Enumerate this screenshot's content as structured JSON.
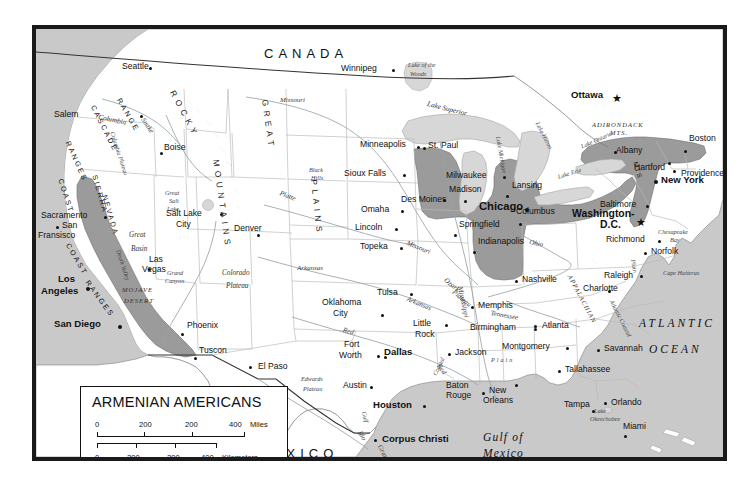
{
  "map": {
    "title": "ARMENIAN AMERICANS",
    "theme_note": "Shaded areas indicate regions of Armenian American population concentration",
    "colors": {
      "ocean": "#c9c9c9",
      "land": "#ffffff",
      "shaded_population": "#9b9b9b",
      "lake": "#d7d7d7",
      "border": "#1a1a1a",
      "state_line": "#b4b4b4",
      "river": "#9aa3a8"
    },
    "legend": {
      "title": "ARMENIAN AMERICANS",
      "miles_scale": {
        "ticks": [
          "0",
          "200",
          "200",
          "400"
        ],
        "unit": "Miles"
      },
      "kilometers_scale": {
        "ticks": [
          "0",
          "200",
          "200",
          "400"
        ],
        "unit": "Kilometers"
      }
    },
    "countries": [
      {
        "name": "CANADA",
        "x": 260,
        "y": 43
      },
      {
        "name": "MEXICO",
        "x": 253,
        "y": 443
      }
    ],
    "oceans": [
      {
        "name": "ATLANTIC",
        "x": 635,
        "y": 314
      },
      {
        "name": "OCEAN",
        "x": 645,
        "y": 340
      },
      {
        "name": "Gulf of",
        "x": 479,
        "y": 428
      },
      {
        "name": "Mexico",
        "x": 479,
        "y": 444
      }
    ],
    "cities": [
      {
        "name": "Seattle",
        "x": 108,
        "y": 59,
        "dx": 41,
        "dy": 4,
        "class": "city"
      },
      {
        "name": "Salem",
        "x": 50,
        "y": 110,
        "dx": 36,
        "dy": 3,
        "class": "city"
      },
      {
        "name": "Boise",
        "x": 158,
        "y": 138,
        "dx": -4,
        "dy": 11,
        "class": "city"
      },
      {
        "name": "Sacramento",
        "x": 37,
        "y": 209,
        "dx": 63,
        "dy": 4,
        "class": "city"
      },
      {
        "name": "San",
        "x": 60,
        "y": 219,
        "dx": -8,
        "dy": 4,
        "class": "city"
      },
      {
        "name": "Fransisco",
        "x": 42,
        "y": 229,
        "dx": null,
        "dy": null,
        "class": "city"
      },
      {
        "name": "Los",
        "x": 55,
        "y": 270,
        "dx": null,
        "dy": null,
        "class": "city-med"
      },
      {
        "name": "Angeles",
        "x": 41,
        "y": 282,
        "dx": null,
        "dy": null,
        "class": "city-med"
      },
      {
        "name": "San Diego",
        "x": 48,
        "y": 316,
        "dx": 66,
        "dy": 5,
        "class": "city-med"
      },
      {
        "name": "Las",
        "x": 139,
        "y": 253,
        "dx": null,
        "dy": null,
        "class": "city"
      },
      {
        "name": "Vegas",
        "x": 132,
        "y": 263,
        "dx": -4,
        "dy": 12,
        "class": "city"
      },
      {
        "name": "Salt Lake",
        "x": 160,
        "y": 206,
        "dx": 56,
        "dy": 3,
        "class": "city"
      },
      {
        "name": "City",
        "x": 170,
        "y": 217,
        "dx": null,
        "dy": null,
        "class": "city"
      },
      {
        "name": "Phoenix",
        "x": 183,
        "y": 318,
        "dx": -6,
        "dy": 11,
        "class": "city"
      },
      {
        "name": "Tuscon",
        "x": 196,
        "y": 342,
        "dx": -6,
        "dy": 11,
        "class": "city"
      },
      {
        "name": "El Paso",
        "x": 254,
        "y": 359,
        "dx": -9,
        "dy": 4,
        "class": "city"
      },
      {
        "name": "Denver",
        "x": 231,
        "y": 220,
        "dx": 23,
        "dy": 12,
        "class": "city"
      },
      {
        "name": "Winnipeg",
        "x": 335,
        "y": 67,
        "dx": 53,
        "dy": -2,
        "class": "city"
      },
      {
        "name": "Minneapolis",
        "x": 356,
        "y": 137,
        "dx": 57,
        "dy": 5,
        "class": "city"
      },
      {
        "name": "St. Paul",
        "x": 424,
        "y": 138,
        "dx": -5,
        "dy": 5,
        "class": "city"
      },
      {
        "name": "Sioux Falls",
        "x": 340,
        "y": 167,
        "dx": 59,
        "dy": 3,
        "class": "city"
      },
      {
        "name": "Des Moines",
        "x": 398,
        "y": 192,
        "dx": 63,
        "dy": 4,
        "class": "city"
      },
      {
        "name": "Omaha",
        "x": 357,
        "y": 202,
        "dx": 40,
        "dy": 4,
        "class": "city"
      },
      {
        "name": "Lincoln",
        "x": 351,
        "y": 221,
        "dx": 40,
        "dy": 3,
        "class": "city"
      },
      {
        "name": "Topeka",
        "x": 356,
        "y": 239,
        "dx": 40,
        "dy": 4,
        "class": "city"
      },
      {
        "name": "Milwaukee",
        "x": 442,
        "y": 167,
        "dx": 57,
        "dy": 5,
        "class": "city"
      },
      {
        "name": "Madison",
        "x": 445,
        "y": 181,
        "dx": -6,
        "dy": 11,
        "class": "city"
      },
      {
        "name": "Lansing",
        "x": 508,
        "y": 177,
        "dx": -6,
        "dy": 11,
        "class": "city"
      },
      {
        "name": "Chicago",
        "x": 475,
        "y": 198,
        "dx": 47,
        "dy": 6,
        "class": "city-big"
      },
      {
        "name": "Springfield",
        "x": 455,
        "y": 216,
        "dx": -4,
        "dy": 12,
        "class": "city"
      },
      {
        "name": "Indianapolis",
        "x": 474,
        "y": 233,
        "dx": -4,
        "dy": 12,
        "class": "city"
      },
      {
        "name": "Columbus",
        "x": 512,
        "y": 203,
        "dx": 3,
        "dy": 12,
        "class": "city"
      },
      {
        "name": "Ottawa",
        "x": 578,
        "y": 92,
        "dx": null,
        "dy": null,
        "class": "city-med"
      },
      {
        "name": "Albany",
        "x": 612,
        "y": 143,
        "dx": 36,
        "dy": 3,
        "class": "city"
      },
      {
        "name": "Boston",
        "x": 685,
        "y": 131,
        "dx": -5,
        "dy": 11,
        "class": "city"
      },
      {
        "name": "Hartford",
        "x": 630,
        "y": 159,
        "dx": 36,
        "dy": -8,
        "class": "city"
      },
      {
        "name": "Providence",
        "x": 677,
        "y": 155,
        "dx": -6,
        "dy": -4,
        "class": "city"
      },
      {
        "name": "New York",
        "x": 657,
        "y": 170,
        "dx": -9,
        "dy": 5,
        "class": "city-med"
      },
      {
        "name": "Baltimore",
        "x": 596,
        "y": 196,
        "dx": 47,
        "dy": 4,
        "class": "city"
      },
      {
        "name": "Washington-",
        "x": 585,
        "y": 205,
        "dx": null,
        "dy": null,
        "class": "capital"
      },
      {
        "name": "D.C.",
        "x": 605,
        "y": 216,
        "dx": null,
        "dy": null,
        "class": "capital"
      },
      {
        "name": "Richmond",
        "x": 603,
        "y": 231,
        "dx": 52,
        "dy": 5,
        "class": "city"
      },
      {
        "name": "Norfolk",
        "x": 648,
        "y": 243,
        "dx": -8,
        "dy": 4,
        "class": "city"
      },
      {
        "name": "Raleigh",
        "x": 600,
        "y": 268,
        "dx": 37,
        "dy": 2,
        "class": "city"
      },
      {
        "name": "Charlotte",
        "x": 580,
        "y": 287,
        "dx": -7,
        "dy": -6,
        "class": "city"
      },
      {
        "name": "Nashville",
        "x": 517,
        "y": 271,
        "dx": -9,
        "dy": 3,
        "class": "city"
      },
      {
        "name": "Memphis",
        "x": 473,
        "y": 297,
        "dx": -9,
        "dy": 4,
        "class": "city"
      },
      {
        "name": "Birmingham",
        "x": 468,
        "y": 319,
        "dx": 63,
        "dy": 4,
        "class": "city"
      },
      {
        "name": "Atlanta",
        "x": 538,
        "y": 317,
        "dx": -8,
        "dy": 3,
        "class": "city"
      },
      {
        "name": "Montgomery",
        "x": 500,
        "y": 338,
        "dx": 63,
        "dy": 4,
        "class": "city"
      },
      {
        "name": "Savannah",
        "x": 601,
        "y": 340,
        "dx": -8,
        "dy": 3,
        "class": "city"
      },
      {
        "name": "Tallahassee",
        "x": 562,
        "y": 361,
        "dx": -8,
        "dy": 3,
        "class": "city"
      },
      {
        "name": "Tampa",
        "x": 562,
        "y": 396,
        "dx": 36,
        "dy": 7,
        "class": "city"
      },
      {
        "name": "Orlando",
        "x": 608,
        "y": 394,
        "dx": -8,
        "dy": 2,
        "class": "city"
      },
      {
        "name": "Miami",
        "x": 620,
        "y": 418,
        "dx": 10,
        "dy": 11,
        "class": "city"
      },
      {
        "name": "Jackson",
        "x": 452,
        "y": 344,
        "dx": -8,
        "dy": 4,
        "class": "city"
      },
      {
        "name": "Baton",
        "x": 443,
        "y": 379,
        "dx": 38,
        "dy": -2,
        "class": "city"
      },
      {
        "name": "Rouge",
        "x": 443,
        "y": 389,
        "dx": null,
        "dy": null,
        "class": "city"
      },
      {
        "name": "New",
        "x": 486,
        "y": 382,
        "dx": -7,
        "dy": 3,
        "class": "city"
      },
      {
        "name": "Orleans",
        "x": 480,
        "y": 392,
        "dx": null,
        "dy": null,
        "class": "city"
      },
      {
        "name": "Little",
        "x": 410,
        "y": 314,
        "dx": 31,
        "dy": 3,
        "class": "city"
      },
      {
        "name": "Rock",
        "x": 412,
        "y": 325,
        "dx": null,
        "dy": null,
        "class": "city"
      },
      {
        "name": "Tulsa",
        "x": 374,
        "y": 283,
        "dx": 32,
        "dy": 3,
        "class": "city"
      },
      {
        "name": "Oklahoma",
        "x": 319,
        "y": 294,
        "dx": 58,
        "dy": 14,
        "class": "city"
      },
      {
        "name": "City",
        "x": 330,
        "y": 305,
        "dx": null,
        "dy": null,
        "class": "city"
      },
      {
        "name": "Fort",
        "x": 341,
        "y": 336,
        "dx": 39,
        "dy": 12,
        "class": "city"
      },
      {
        "name": "Worth",
        "x": 336,
        "y": 347,
        "dx": null,
        "dy": null,
        "class": "city"
      },
      {
        "name": "Dallas",
        "x": 381,
        "y": 345,
        "dx": -9,
        "dy": 4,
        "class": "city-med"
      },
      {
        "name": "Austin",
        "x": 340,
        "y": 377,
        "dx": 26,
        "dy": 12,
        "class": "city"
      },
      {
        "name": "Houston",
        "x": 370,
        "y": 398,
        "dx": 49,
        "dy": -2,
        "class": "city-med"
      },
      {
        "name": "Corpus Christi",
        "x": 379,
        "y": 430,
        "dx": -9,
        "dy": 4,
        "class": "city-med"
      }
    ],
    "physical_features": [
      {
        "name": "Lake of the",
        "x": 404,
        "y": 58,
        "class": "phys-sm"
      },
      {
        "name": "Woods",
        "x": 406,
        "y": 67,
        "class": "phys-sm"
      },
      {
        "name": "Lake Superior",
        "x": 424,
        "y": 97,
        "class": "phys",
        "rot": 14
      },
      {
        "name": "Lake Michigan",
        "x": 497,
        "y": 132,
        "class": "phys-sm",
        "rot": 80
      },
      {
        "name": "Lake Huron",
        "x": 536,
        "y": 117,
        "class": "phys-sm",
        "rot": 63
      },
      {
        "name": "Lake Erie",
        "x": 553,
        "y": 170,
        "class": "phys-sm",
        "rot": -17
      },
      {
        "name": "Lake Ontario",
        "x": 576,
        "y": 140,
        "class": "phys-sm",
        "rot": -24
      },
      {
        "name": "ADIRONDACK",
        "x": 588,
        "y": 118,
        "class": "phys-cap"
      },
      {
        "name": "MTS.",
        "x": 606,
        "y": 126,
        "class": "phys-cap"
      },
      {
        "name": "Great",
        "x": 161,
        "y": 186,
        "class": "phys-sm"
      },
      {
        "name": "Salt",
        "x": 165,
        "y": 194,
        "class": "phys-sm"
      },
      {
        "name": "Lake",
        "x": 163,
        "y": 202,
        "class": "phys-sm"
      },
      {
        "name": "Great",
        "x": 125,
        "y": 228,
        "class": "phys"
      },
      {
        "name": "Basin",
        "x": 127,
        "y": 242,
        "class": "phys"
      },
      {
        "name": "Death Valley",
        "x": 117,
        "y": 245,
        "class": "phys-sm",
        "rot": 72
      },
      {
        "name": "MOJAVE",
        "x": 118,
        "y": 283,
        "class": "phys-cap"
      },
      {
        "name": "DESERT",
        "x": 120,
        "y": 294,
        "class": "phys-cap"
      },
      {
        "name": "Grand",
        "x": 163,
        "y": 266,
        "class": "phys-sm"
      },
      {
        "name": "Canyon",
        "x": 161,
        "y": 274,
        "class": "phys-sm"
      },
      {
        "name": "Colorado",
        "x": 150,
        "y": 266,
        "class": "phys"
      },
      {
        "name": "Plateau",
        "x": 152,
        "y": 279,
        "class": "phys"
      },
      {
        "name": "Columbia",
        "x": 95,
        "y": 110,
        "class": "phys",
        "rot": 12
      },
      {
        "name": "Columbia Plateau",
        "x": 111,
        "y": 127,
        "class": "phys-sm",
        "rot": 72
      },
      {
        "name": "Black",
        "x": 305,
        "y": 163,
        "class": "phys-sm"
      },
      {
        "name": "Hills",
        "x": 307,
        "y": 171,
        "class": "phys-sm"
      },
      {
        "name": "Ozark",
        "x": 443,
        "y": 273,
        "class": "phys",
        "rot": 40
      },
      {
        "name": "Plateau",
        "x": 451,
        "y": 285,
        "class": "phys",
        "rot": 40
      },
      {
        "name": "Edwards",
        "x": 297,
        "y": 372,
        "class": "phys-sm"
      },
      {
        "name": "Plateau",
        "x": 299,
        "y": 382,
        "class": "phys-sm"
      },
      {
        "name": "Chesapeake",
        "x": 654,
        "y": 225,
        "class": "phys-sm"
      },
      {
        "name": "Bay",
        "x": 666,
        "y": 233,
        "class": "phys-sm"
      },
      {
        "name": "Cape Hatteras",
        "x": 659,
        "y": 266,
        "class": "phys-sm"
      },
      {
        "name": "Lake",
        "x": 590,
        "y": 404,
        "class": "phys-sm"
      },
      {
        "name": "Okeechobee",
        "x": 586,
        "y": 412,
        "class": "phys-sm"
      },
      {
        "name": "APPALACHIAN",
        "x": 568,
        "y": 270,
        "class": "phys-cap",
        "rot": 62
      },
      {
        "name": "Atlantic Coastal",
        "x": 610,
        "y": 295,
        "class": "phys-sm",
        "rot": 63
      },
      {
        "name": "Plain",
        "x": 632,
        "y": 255,
        "class": "phys-sm",
        "rot": 80
      },
      {
        "name": "Coastal",
        "x": 428,
        "y": 370,
        "class": "phys-sm",
        "rot": -65
      },
      {
        "name": "Plain",
        "x": 487,
        "y": 353,
        "class": "phys-sm"
      },
      {
        "name": "Gulf",
        "x": 363,
        "y": 407,
        "class": "phys-sm",
        "rot": 78
      }
    ],
    "rivers": [
      {
        "name": "Missouri",
        "x": 276,
        "y": 93,
        "rot": 0
      },
      {
        "name": "Snake",
        "x": 141,
        "y": 113,
        "rot": 55
      },
      {
        "name": "Missouri",
        "x": 404,
        "y": 236,
        "rot": 22
      },
      {
        "name": "Platte",
        "x": 277,
        "y": 186,
        "rot": 22
      },
      {
        "name": "Arkansas",
        "x": 293,
        "y": 261,
        "rot": 0
      },
      {
        "name": "Arkansas",
        "x": 404,
        "y": 292,
        "rot": 22
      },
      {
        "name": "Mississippi",
        "x": 459,
        "y": 282,
        "rot": 78
      },
      {
        "name": "Tennessee",
        "x": 487,
        "y": 306,
        "rot": 10
      },
      {
        "name": "Ohio",
        "x": 526,
        "y": 235,
        "rot": 12
      },
      {
        "name": "Red",
        "x": 340,
        "y": 323,
        "rot": 16
      },
      {
        "name": "Red",
        "x": 437,
        "y": 359,
        "rot": 55
      },
      {
        "name": "Rio",
        "x": 358,
        "y": 426,
        "rot": 58
      },
      {
        "name": "Grande",
        "x": 378,
        "y": 440,
        "rot": 62
      }
    ],
    "mountain_ranges": [
      {
        "name": "ROCKY",
        "x": 172,
        "y": 85,
        "rot": 62
      },
      {
        "name": "MOUNTAINS",
        "x": 216,
        "y": 155,
        "rot": 80
      },
      {
        "name": "GREAT",
        "x": 265,
        "y": 95,
        "rot": 80
      },
      {
        "name": "PLAINS",
        "x": 314,
        "y": 175,
        "rot": 82
      },
      {
        "name": "CASCADE",
        "x": 92,
        "y": 100,
        "rot": 60
      },
      {
        "name": "RANGE",
        "x": 117,
        "y": 94,
        "rot": 58
      },
      {
        "name": "RANGES",
        "x": 67,
        "y": 136,
        "rot": 64
      },
      {
        "name": "COAST",
        "x": 60,
        "y": 174,
        "rot": 70
      },
      {
        "name": "SIERRA",
        "x": 94,
        "y": 170,
        "rot": 72
      },
      {
        "name": "NEVADA",
        "x": 104,
        "y": 190,
        "rot": 72
      },
      {
        "name": "COAST",
        "x": 67,
        "y": 238,
        "rot": 58
      },
      {
        "name": "RANGES",
        "x": 86,
        "y": 275,
        "rot": 52
      },
      {
        "name": "MTS",
        "x": 634,
        "y": 157,
        "rot": 72
      }
    ]
  }
}
